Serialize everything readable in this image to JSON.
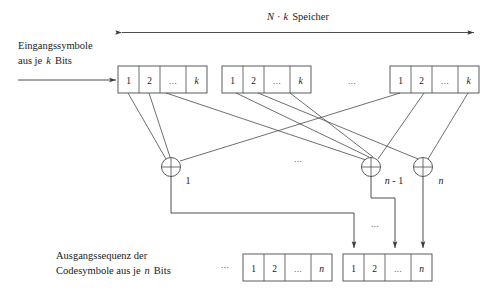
{
  "figure": {
    "title_top": {
      "prefix_italic_n": "N",
      "middot": "·",
      "prefix_italic_k": "k",
      "suffix": "Speicher",
      "full": "N · k Speicher"
    },
    "input_label": {
      "line1": "Eingangssymbole",
      "line2_prefix": "aus je",
      "line2_italic": "k",
      "line2_suffix": "Bits"
    },
    "output_label": {
      "line1": "Ausgangssequenz der",
      "line2_prefix": "Codesymbole aus je",
      "line2_italic": "n",
      "line2_suffix": "Bits"
    },
    "ellipsis": "...",
    "register_cells": [
      "1",
      "2",
      "...",
      "k"
    ],
    "output_cells": [
      "1",
      "2",
      "...",
      "n"
    ],
    "adder_glyph": "⊕",
    "adder_labels": [
      "1",
      "n - 1",
      "n"
    ],
    "colors": {
      "line": "#3a3a3a",
      "box_fill": "#ffffff",
      "text": "#1a1a1a",
      "background": "#ffffff"
    }
  }
}
